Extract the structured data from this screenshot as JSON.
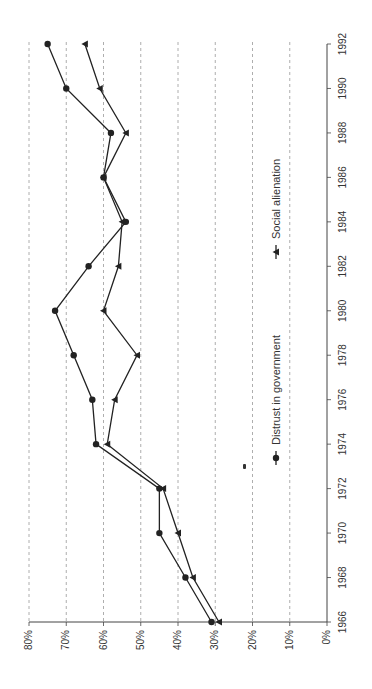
{
  "chart_data": {
    "type": "line",
    "orientation": "rotated-90-clockwise",
    "title": "",
    "xlabel": "",
    "ylabel": "",
    "x": [
      1966,
      1968,
      1970,
      1972,
      1974,
      1976,
      1978,
      1980,
      1982,
      1984,
      1986,
      1988,
      1990,
      1992
    ],
    "x_tick_labels": [
      "1966",
      "1968",
      "1970",
      "1972",
      "1974",
      "1976",
      "1978",
      "1980",
      "1982",
      "1984",
      "1986",
      "1988",
      "1990",
      "1992"
    ],
    "y_tick_labels": [
      "0%",
      "10%",
      "20%",
      "30%",
      "40%",
      "50%",
      "60%",
      "70%",
      "80%"
    ],
    "ylim": [
      0,
      80
    ],
    "grid": "dashed horizontal at each 10%",
    "legend_position": "inside, lower-right (rotated)",
    "series": [
      {
        "name": "Distrust in government",
        "marker": "circle",
        "values": [
          31,
          38,
          45,
          45,
          62,
          63,
          68,
          73,
          64,
          54,
          60,
          58,
          70,
          75
        ]
      },
      {
        "name": "Social alienation",
        "marker": "triangle",
        "values": [
          29,
          36,
          40,
          44,
          59,
          57,
          51,
          60,
          56,
          55,
          60,
          54,
          61,
          65
        ]
      }
    ],
    "colors": {
      "line": "#222222",
      "grid": "#999999",
      "axis": "#444444"
    }
  },
  "legend": {
    "items": [
      {
        "label": "Distrust in government",
        "marker": "circle"
      },
      {
        "label": "Social alienation",
        "marker": "triangle"
      }
    ]
  }
}
